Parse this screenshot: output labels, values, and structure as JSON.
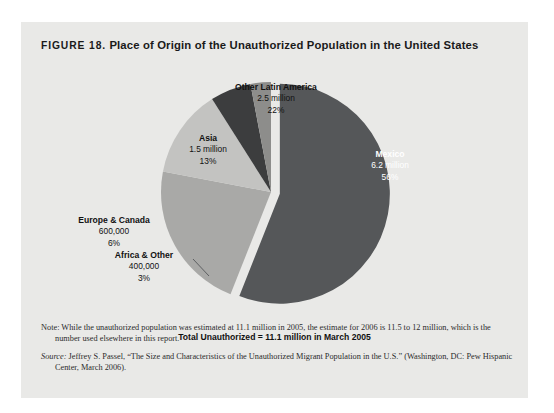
{
  "figure": {
    "number_label": "FIGURE 18.",
    "title": "Place of Origin of the Unauthorized Population in the United States",
    "total_caption": "Total Unauthorized = 11.1 million in March 2005"
  },
  "footnotes": {
    "note_lead": "Note:",
    "note_text": " While the unauthorized population was estimated at 11.1 million in 2005, the estimate for 2006 is 11.5 to 12 million, which is the number used elsewhere in this report.",
    "source_lead": "Source:",
    "source_text": " Jeffrey S. Passel, “The Size and Characteristics of the Unauthorized Migrant Population in the U.S.” (Washington, DC: Pew Hispanic Center, March 2006)."
  },
  "colors": {
    "panel_background": "#e9e9e7",
    "page_background": "#ffffff",
    "mexico": "#555759",
    "other_latin_america": "#a9a9a7",
    "asia": "#c3c3c1",
    "europe_canada": "#3c3d3e",
    "africa_other": "#8d8d8b",
    "text_dark": "#111111",
    "text_light": "#ffffff"
  },
  "chart_data": {
    "type": "pie",
    "title": "Place of Origin of the Unauthorized Population in the United States",
    "total_label": "Total Unauthorized = 11.1 million in March 2005",
    "total_value": 11.1,
    "unit": "million",
    "legend": "none (labels placed on/near slices)",
    "categories": [
      "Mexico",
      "Other Latin America",
      "Asia",
      "Europe & Canada",
      "Africa & Other"
    ],
    "values": [
      56,
      22,
      13,
      6,
      3
    ],
    "value_labels": [
      "6.2 million",
      "2.5 million",
      "1.5 million",
      "600,000",
      "400,000"
    ],
    "percent_labels": [
      "56%",
      "22%",
      "13%",
      "6%",
      "3%"
    ],
    "slices": [
      {
        "name": "Mexico",
        "value_label": "6.2 million",
        "percent_label": "56%",
        "percent": 56,
        "value_millions": 6.2,
        "color": "#555759",
        "exploded": true,
        "label_on_dark": true
      },
      {
        "name": "Other Latin America",
        "value_label": "2.5 million",
        "percent_label": "22%",
        "percent": 22,
        "value_millions": 2.5,
        "color": "#a9a9a7",
        "exploded": false,
        "label_on_dark": false
      },
      {
        "name": "Asia",
        "value_label": "1.5 million",
        "percent_label": "13%",
        "percent": 13,
        "value_millions": 1.5,
        "color": "#c3c3c1",
        "exploded": false,
        "label_on_dark": false
      },
      {
        "name": "Europe & Canada",
        "value_label": "600,000",
        "percent_label": "6%",
        "percent": 6,
        "value_millions": 0.6,
        "color": "#3c3d3e",
        "exploded": false,
        "label_on_dark": false
      },
      {
        "name": "Africa & Other",
        "value_label": "400,000",
        "percent_label": "3%",
        "percent": 3,
        "value_millions": 0.4,
        "color": "#8d8d8b",
        "exploded": false,
        "label_on_dark": false,
        "has_leader_line": true
      }
    ]
  }
}
